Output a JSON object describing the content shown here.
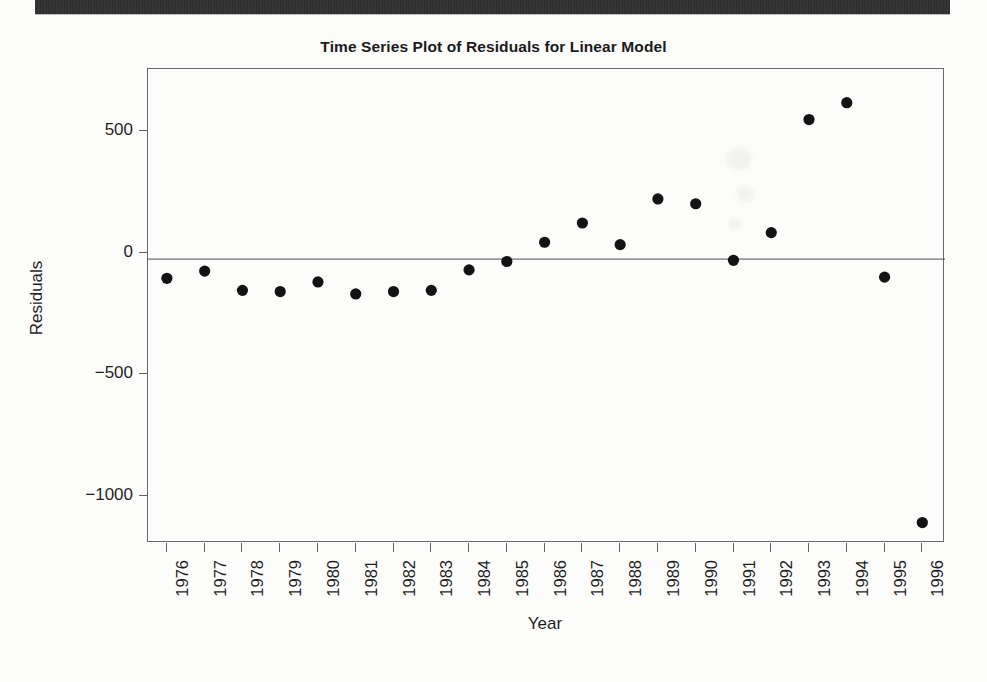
{
  "page": {
    "background_color": "#fcfcfb",
    "scan_bar_color": "#2e2e2e"
  },
  "chart_data": {
    "type": "scatter",
    "title": "Time Series Plot of Residuals for Linear Model",
    "xlabel": "Year",
    "ylabel": "Residuals",
    "x": [
      1976,
      1977,
      1978,
      1979,
      1980,
      1981,
      1982,
      1983,
      1984,
      1985,
      1986,
      1987,
      1988,
      1989,
      1990,
      1991,
      1992,
      1993,
      1994,
      1995,
      1996
    ],
    "categories": [
      "1976",
      "1977",
      "1978",
      "1979",
      "1980",
      "1981",
      "1982",
      "1983",
      "1984",
      "1985",
      "1986",
      "1987",
      "1988",
      "1989",
      "1990",
      "1991",
      "1992",
      "1993",
      "1994",
      "1995",
      "1996"
    ],
    "values": [
      -80,
      -50,
      -130,
      -135,
      -95,
      -145,
      -135,
      -130,
      -45,
      -10,
      70,
      150,
      60,
      250,
      230,
      -5,
      110,
      580,
      650,
      -75,
      -1095
    ],
    "xlim": [
      1975.5,
      1996.6
    ],
    "ylim": [
      -1180,
      790
    ],
    "yticks": [
      500,
      0,
      -500,
      -1000
    ],
    "ytick_labels": [
      "500",
      "0",
      "−500",
      "−1000"
    ],
    "grid": false,
    "legend": null,
    "annotations": [
      {
        "name": "zero-reference-line",
        "y": 0
      }
    ],
    "marker": {
      "shape": "circle",
      "color": "#131313",
      "size": 5.6
    },
    "axis_color": "#5f6366",
    "frame": true
  }
}
